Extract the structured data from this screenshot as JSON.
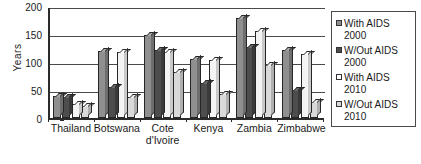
{
  "chart_data": {
    "type": "bar",
    "title": "",
    "xlabel": "",
    "ylabel": "Years",
    "ylim": [
      0,
      200
    ],
    "yticks": [
      0,
      50,
      100,
      150,
      200
    ],
    "grid": true,
    "legend_position": "right",
    "categories": [
      "Thailand",
      "Botswana",
      "Cote d'Ivoire",
      "Kenya",
      "Zambia",
      "Zimbabwe"
    ],
    "series": [
      {
        "name": "With AIDS 2000",
        "color": "#8f8f8f",
        "values": [
          40,
          120,
          148,
          105,
          178,
          122
        ]
      },
      {
        "name": "W/Out AIDS 2000",
        "color": "#4d4d4d",
        "values": [
          37,
          55,
          122,
          62,
          126,
          50
        ]
      },
      {
        "name": "With AIDS 2010",
        "color": "#ffffff",
        "values": [
          25,
          118,
          118,
          103,
          156,
          114
        ]
      },
      {
        "name": "W/Out AIDS 2010",
        "color": "#d9d9d9",
        "values": [
          22,
          38,
          83,
          42,
          95,
          28
        ]
      }
    ]
  },
  "axes": {
    "y_title": "Years",
    "y_tick_labels": [
      "0",
      "50",
      "100",
      "150",
      "200"
    ],
    "x_tick_labels": [
      "Thailand",
      "Botswana",
      "Cote\nd'Ivoire",
      "Kenya",
      "Zambia",
      "Zimbabwe"
    ]
  },
  "legend": {
    "items": [
      {
        "label": "With AIDS\n2000",
        "swatch": "legend-swatch-with-aids-2000"
      },
      {
        "label": "W/Out AIDS\n2000",
        "swatch": "legend-swatch-without-aids-2000"
      },
      {
        "label": "With AIDS\n2010",
        "swatch": "legend-swatch-with-aids-2010"
      },
      {
        "label": "W/Out AIDS\n2010",
        "swatch": "legend-swatch-without-aids-2010"
      }
    ]
  }
}
